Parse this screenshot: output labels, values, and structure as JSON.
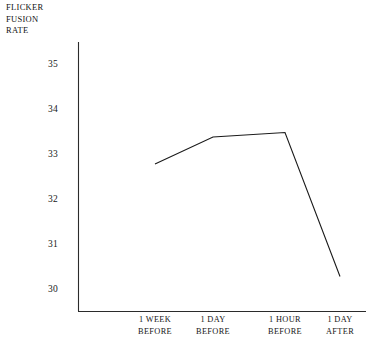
{
  "chart_data": {
    "type": "line",
    "title": "",
    "subtitle": "",
    "ylabel": "FLICKER\nFUSION\nRATE",
    "xlabel": "",
    "categories": [
      "1 WEEK\nBEFORE",
      "1 DAY\nBEFORE",
      "1 HOUR\nBEFORE",
      "1 DAY\nAFTER"
    ],
    "category_labels_flat": [
      "1 WEEK BEFORE",
      "1 DAY BEFORE",
      "1 HOUR BEFORE",
      "1 DAY AFTER"
    ],
    "values": [
      32.8,
      33.4,
      33.5,
      30.3
    ],
    "series": [
      {
        "name": "Flicker fusion rate",
        "values": [
          32.8,
          33.4,
          33.5,
          30.3
        ]
      }
    ],
    "yticks": [
      35,
      34,
      33,
      32,
      31,
      30
    ],
    "ytick_labels": [
      "35",
      "34",
      "33",
      "32",
      "31",
      "30"
    ],
    "ylim": [
      30,
      35
    ],
    "grid": false,
    "legend": null,
    "legend_position": "none",
    "line_color": "#1a1a1a",
    "axis_color": "#2b2b2b",
    "background_color": "#ffffff",
    "markers": false
  },
  "axis": {
    "y_label_line1": "FLICKER",
    "y_label_line2": "FUSION",
    "y_label_line3": "RATE"
  }
}
